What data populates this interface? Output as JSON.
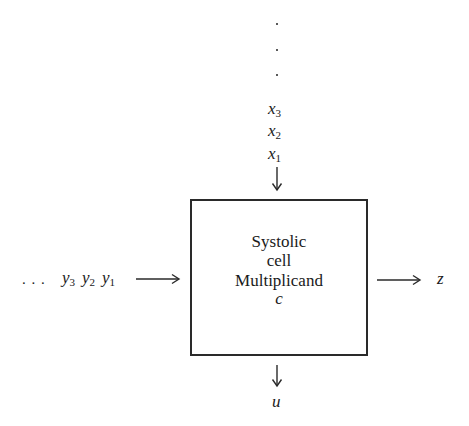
{
  "diagram": {
    "type": "block-diagram",
    "cell": {
      "lines": [
        "Systolic",
        "cell",
        "Multiplicand"
      ],
      "parameter": "c"
    },
    "top_input": {
      "ellipsis": [
        "·",
        "·",
        "·"
      ],
      "sequence": [
        {
          "base": "x",
          "sub": "3"
        },
        {
          "base": "x",
          "sub": "2"
        },
        {
          "base": "x",
          "sub": "1"
        }
      ],
      "direction": "down"
    },
    "left_input": {
      "ellipsis": ". . .",
      "sequence": [
        {
          "base": "y",
          "sub": "3"
        },
        {
          "base": "y",
          "sub": "2"
        },
        {
          "base": "y",
          "sub": "1"
        }
      ],
      "direction": "right"
    },
    "right_output": {
      "label": "z",
      "direction": "right"
    },
    "bottom_output": {
      "label": "u",
      "direction": "down"
    },
    "colors": {
      "stroke": "#2a2a2a",
      "background": "#ffffff"
    }
  }
}
